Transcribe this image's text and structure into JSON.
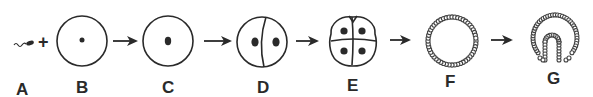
{
  "diagram": {
    "operator": "+",
    "stages": [
      {
        "id": "A",
        "label": "A",
        "depicts": "sperm"
      },
      {
        "id": "B",
        "label": "B",
        "depicts": "egg (ovum) with nucleus"
      },
      {
        "id": "C",
        "label": "C",
        "depicts": "zygote (fertilized egg)"
      },
      {
        "id": "D",
        "label": "D",
        "depicts": "two-cell stage"
      },
      {
        "id": "E",
        "label": "E",
        "depicts": "four-cell stage"
      },
      {
        "id": "F",
        "label": "F",
        "depicts": "blastula (hollow ball of cells)"
      },
      {
        "id": "G",
        "label": "G",
        "depicts": "gastrula (invaginating)"
      }
    ],
    "arrows": [
      {
        "from": "B",
        "to": "C"
      },
      {
        "from": "C",
        "to": "D"
      },
      {
        "from": "D",
        "to": "E"
      },
      {
        "from": "E",
        "to": "F"
      },
      {
        "from": "F",
        "to": "G"
      }
    ],
    "colors": {
      "ink": "#2a2a2a",
      "background": "#ffffff"
    }
  }
}
